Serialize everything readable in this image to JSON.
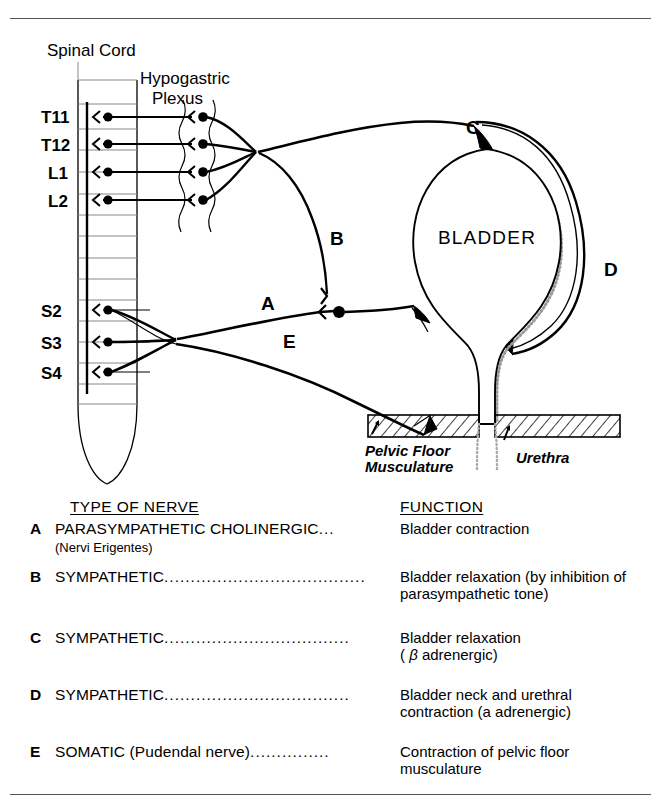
{
  "figure": {
    "title_labels": {
      "spinal_cord": "Spinal Cord",
      "hypogastric_plexus_line1": "Hypogastric",
      "hypogastric_plexus_line2": "Plexus",
      "bladder": "BLADDER",
      "pelvic_floor_line1": "Pelvic Floor",
      "pelvic_floor_line2": "Musculature",
      "urethra": "Urethra"
    },
    "spinal_segments": [
      "T11",
      "T12",
      "L1",
      "L2",
      "S2",
      "S3",
      "S4"
    ],
    "nerve_path_labels": [
      "A",
      "B",
      "C",
      "D",
      "E"
    ],
    "colors": {
      "ink": "#000000",
      "paper": "#ffffff",
      "frame_rule": "#555555",
      "bladder_shading": "#b0b0b0"
    }
  },
  "legend": {
    "header_type": "TYPE OF NERVE",
    "header_function": "FUNCTION",
    "rows": [
      {
        "key": "A",
        "type": "PARASYMPATHETIC CHOLINERGIC",
        "leader": "...",
        "subtype": "(Nervi Erigentes)",
        "function": "Bladder contraction"
      },
      {
        "key": "B",
        "type": "SYMPATHETIC",
        "leader": "......................................",
        "subtype": "",
        "function": "Bladder relaxation (by inhibition of parasympathetic tone)"
      },
      {
        "key": "C",
        "type": "SYMPATHETIC",
        "leader": "...................................",
        "subtype": "",
        "function": "Bladder relaxation (β adrenergic)",
        "function_line1": "Bladder relaxation",
        "function_line2_pre": "( ",
        "function_greek": "β",
        "function_line2_post": " adrenergic)"
      },
      {
        "key": "D",
        "type": "SYMPATHETIC",
        "leader": "...................................",
        "subtype": "",
        "function": "Bladder neck and urethral contraction (a adrenergic)",
        "function_line1": "Bladder neck and urethral",
        "function_line2": "contraction (a adrenergic)"
      },
      {
        "key": "E",
        "type": "SOMATIC (Pudendal nerve)",
        "leader": "...............",
        "subtype": "",
        "function": "Contraction of pelvic floor musculature",
        "function_line1": "Contraction of pelvic floor",
        "function_line2": "musculature"
      }
    ]
  }
}
